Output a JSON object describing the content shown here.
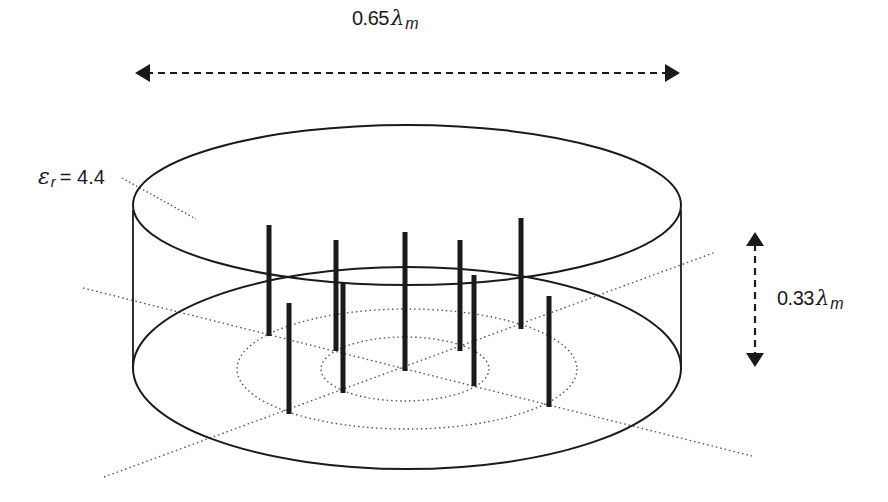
{
  "figure": {
    "type": "antenna-geometry-diagram"
  },
  "labels": {
    "width": {
      "value": "0.65",
      "symbol": "λ",
      "subscript": "m"
    },
    "height": {
      "value": "0.33",
      "symbol": "λ",
      "subscript": "m"
    },
    "permittivity": {
      "symbol": "ε",
      "subscript": "r",
      "equals": "= 4.4"
    }
  },
  "dimensions": {
    "cylinder_diameter": "0.65λm",
    "cylinder_height": "0.33λm",
    "relative_permittivity": 4.4
  },
  "colors": {
    "stroke": "#1a1a1a",
    "dotted": "#555555",
    "pin": "#1a1a1a",
    "background": "#ffffff"
  },
  "geometry": {
    "top_ellipse": {
      "cx": 407,
      "cy": 205,
      "rx": 274,
      "ry": 80
    },
    "bottom_ellipse": {
      "cx": 407,
      "cy": 368,
      "rx": 274,
      "ry": 101
    },
    "inner_ring_outer": {
      "cx": 407,
      "cy": 369,
      "rx": 170,
      "ry": 60
    },
    "inner_ring_inner": {
      "cx": 405,
      "cy": 369,
      "rx": 84,
      "ry": 32
    },
    "pins": [
      {
        "x": 269,
        "top": 225,
        "bottom": 335
      },
      {
        "x": 336,
        "top": 240,
        "bottom": 350
      },
      {
        "x": 405,
        "top": 232,
        "bottom": 370
      },
      {
        "x": 460,
        "top": 240,
        "bottom": 350
      },
      {
        "x": 521,
        "top": 218,
        "bottom": 328
      },
      {
        "x": 289,
        "top": 303,
        "bottom": 413
      },
      {
        "x": 343,
        "top": 282,
        "bottom": 392
      },
      {
        "x": 474,
        "top": 275,
        "bottom": 385
      },
      {
        "x": 549,
        "top": 296,
        "bottom": 406
      }
    ],
    "axes_dotted": [
      {
        "x1": 83,
        "y1": 288,
        "x2": 752,
        "y2": 456
      },
      {
        "x1": 104,
        "y1": 477,
        "x2": 716,
        "y2": 252
      }
    ],
    "leader_line": {
      "x1": 122,
      "y1": 178,
      "x2": 196,
      "y2": 219
    },
    "width_arrow": {
      "x1": 135,
      "x2": 680,
      "y": 73
    },
    "height_arrow": {
      "x": 755,
      "y1": 232,
      "y2": 367
    }
  }
}
